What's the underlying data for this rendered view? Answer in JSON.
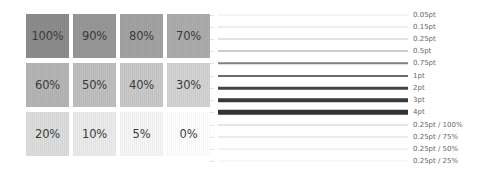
{
  "swatches": [
    {
      "label": "100%",
      "color": "#8c8c8c"
    },
    {
      "label": "90%",
      "color": "#979797"
    },
    {
      "label": "80%",
      "color": "#a3a3a3"
    },
    {
      "label": "70%",
      "color": "#acacac"
    },
    {
      "label": "60%",
      "color": "#b5b5b5"
    },
    {
      "label": "50%",
      "color": "#bfbfbf"
    },
    {
      "label": "40%",
      "color": "#c9c9c9"
    },
    {
      "label": "30%",
      "color": "#d3d3d3"
    },
    {
      "label": "20%",
      "color": "#dddddd"
    },
    {
      "label": "10%",
      "color": "#ebebeb"
    },
    {
      "label": "5%",
      "color": "#f7f7f7"
    },
    {
      "label": "0%",
      "color": "#ffffff"
    }
  ],
  "lines": [
    {
      "label": "0.05pt",
      "thickness": 1,
      "color": "#eeeeee",
      "y": 15
    },
    {
      "label": "0.15pt",
      "thickness": 1,
      "color": "#dcdcdc",
      "y": 27
    },
    {
      "label": "0.25pt",
      "thickness": 1,
      "color": "#c8c8c8",
      "y": 39
    },
    {
      "label": "0.5pt",
      "thickness": 1,
      "color": "#9a9a9a",
      "y": 51
    },
    {
      "label": "0.75pt",
      "thickness": 1.5,
      "color": "#808080",
      "y": 63
    },
    {
      "label": "1pt",
      "thickness": 2,
      "color": "#6a6a6a",
      "y": 76
    },
    {
      "label": "2pt",
      "thickness": 2.5,
      "color": "#444444",
      "y": 88
    },
    {
      "label": "3pt",
      "thickness": 3.5,
      "color": "#3a3a3a",
      "y": 100
    },
    {
      "label": "4pt",
      "thickness": 4.5,
      "color": "#333333",
      "y": 112
    },
    {
      "label": "0.25pt / 100%",
      "thickness": 1,
      "color": "#cdcdcd",
      "y": 125
    },
    {
      "label": "0.25pt / 75%",
      "thickness": 1,
      "color": "#dadada",
      "y": 137
    },
    {
      "label": "0.25pt / 50%",
      "thickness": 1,
      "color": "#e6e6e6",
      "y": 149
    },
    {
      "label": "0.25pt / 25%",
      "thickness": 1,
      "color": "#f1f1f1",
      "y": 161
    }
  ]
}
